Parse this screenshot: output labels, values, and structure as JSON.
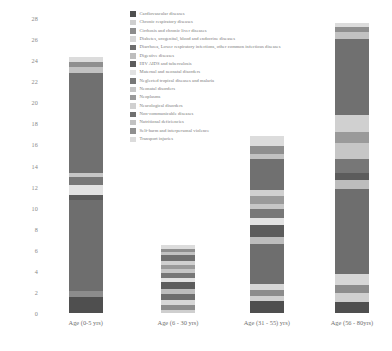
{
  "chart_data": {
    "type": "bar",
    "stacked": true,
    "title": "",
    "xlabel": "",
    "ylabel": "",
    "ylim": [
      0,
      28
    ],
    "ytick_step": 2,
    "yticks": [
      0,
      2,
      4,
      6,
      8,
      10,
      12,
      14,
      16,
      18,
      20,
      22,
      24,
      26,
      28
    ],
    "grid": false,
    "legend_position": "top-center",
    "categories": [
      "Age (0-5 yrs)",
      "Age (6 - 30 yrs)",
      "Age (31 - 55) yrs)",
      "Age (56 - 80yrs)"
    ],
    "totals": [
      24.3,
      6.0,
      15.8,
      27.5
    ],
    "series": [
      {
        "name": "Cardiovascular diseases",
        "color": "#4f4f4f",
        "values": [
          1.5,
          0.0,
          1.1,
          1.0
        ]
      },
      {
        "name": "Chronic respiratory diseases",
        "color": "#cfcfcf",
        "values": [
          0.0,
          0.3,
          0.5,
          0.9
        ]
      },
      {
        "name": "Cirrhosis and chronic liver diseases",
        "color": "#8c8c8c",
        "values": [
          0.6,
          0.5,
          0.6,
          0.8
        ]
      },
      {
        "name": "Diabetes, urogenital, blood and endocrine diseases",
        "color": "#d6d6d6",
        "values": [
          0.0,
          0.4,
          0.6,
          1.0
        ]
      },
      {
        "name": "Diarrhoea, Lower respiratory infections, other common infectious diseases",
        "color": "#6e6e6e",
        "values": [
          8.6,
          0.6,
          3.8,
          8.1
        ]
      },
      {
        "name": "Digestive diseases",
        "color": "#bdbdbd",
        "values": [
          0.0,
          0.5,
          0.6,
          0.8
        ]
      },
      {
        "name": "HIV AIDS and tuberculosis",
        "color": "#5c5c5c",
        "values": [
          0.5,
          0.6,
          1.2,
          0.7
        ]
      },
      {
        "name": "Maternal and neonatal disorders",
        "color": "#e2e2e2",
        "values": [
          1.0,
          0.4,
          0.6,
          0.0
        ]
      },
      {
        "name": "Neglected tropical diseases and malaria",
        "color": "#777777",
        "values": [
          0.7,
          0.5,
          0.9,
          1.3
        ]
      },
      {
        "name": "Neonatal disorders",
        "color": "#c6c6c6",
        "values": [
          0.4,
          0.4,
          0.5,
          1.5
        ]
      },
      {
        "name": "Neoplasms",
        "color": "#9a9a9a",
        "values": [
          0.0,
          0.4,
          0.7,
          1.1
        ]
      },
      {
        "name": "Neurological disorders",
        "color": "#d0d0d0",
        "values": [
          0.0,
          0.3,
          0.6,
          1.6
        ]
      },
      {
        "name": "Non-communicable diseases",
        "color": "#707070",
        "values": [
          9.5,
          0.6,
          2.9,
          7.2
        ]
      },
      {
        "name": "Nutritional deficiencies",
        "color": "#c2c2c2",
        "values": [
          0.6,
          0.3,
          0.5,
          0.7
        ]
      },
      {
        "name": "Self-harm and interpersonal violence",
        "color": "#8f8f8f",
        "values": [
          0.4,
          0.3,
          0.8,
          0.5
        ]
      },
      {
        "name": "Transport injuries",
        "color": "#dcdcdc",
        "values": [
          0.5,
          0.4,
          0.9,
          0.3
        ]
      }
    ]
  }
}
